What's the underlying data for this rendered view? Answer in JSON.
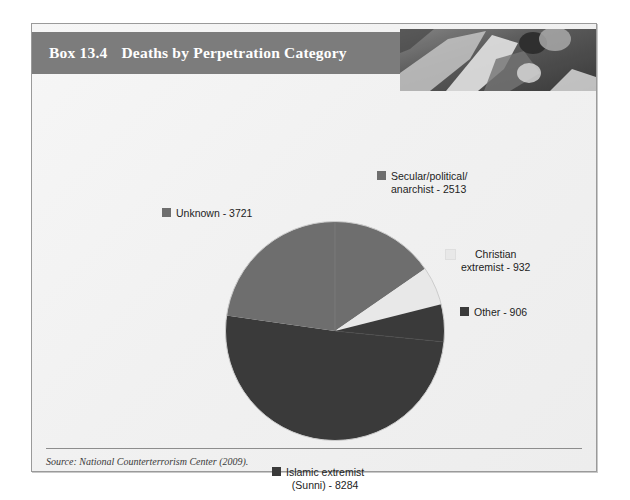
{
  "box": {
    "header": {
      "number": "Box 13.4",
      "title": "Deaths by Perpetration Category"
    },
    "photo_alt": "photo-strip",
    "source": "Source: National Counterterrorism Center (2009)."
  },
  "colors": {
    "header_bar": "#7c7c7c",
    "panel_bg": "#f2f2f2",
    "islamic": "#3a3a3a",
    "unknown": "#6e6e6e",
    "secular": "#6e6e6e",
    "christian": "#e8e8e8",
    "other": "#3a3a3a",
    "rule": "#8d8d8d"
  },
  "chart_data": {
    "type": "pie",
    "title": "Deaths by Perpetration Category",
    "xlabel": "",
    "ylabel": "",
    "legend_position": "callout-labels",
    "total": 16356,
    "categories": [
      "Secular/political/anarchist",
      "Christian extremist",
      "Other",
      "Islamic extremist (Sunni)",
      "Unknown"
    ],
    "values": [
      2513,
      932,
      906,
      8284,
      3721
    ],
    "slices": [
      {
        "key": "secular",
        "label": "Secular/political/\nanarchist - 2513",
        "name": "Secular/political/anarchist",
        "value": 2513,
        "color": "#6e6e6e",
        "start_angle": 0,
        "end_angle": 55.3
      },
      {
        "key": "christian",
        "label": "Christian\nextremist - 932",
        "name": "Christian extremist",
        "value": 932,
        "color": "#e8e8e8",
        "start_angle": 55.3,
        "end_angle": 75.8
      },
      {
        "key": "other",
        "label": "Other - 906",
        "name": "Other",
        "value": 906,
        "color": "#3a3a3a",
        "start_angle": 75.8,
        "end_angle": 95.7
      },
      {
        "key": "islamic",
        "label": "Islamic extremist\n(Sunni) - 8284",
        "name": "Islamic extremist (Sunni)",
        "value": 8284,
        "color": "#3a3a3a",
        "start_angle": 95.7,
        "end_angle": 278.1
      },
      {
        "key": "unknown",
        "label": "Unknown - 3721",
        "name": "Unknown",
        "value": 3721,
        "color": "#6e6e6e",
        "start_angle": 278.1,
        "end_angle": 360
      }
    ]
  }
}
